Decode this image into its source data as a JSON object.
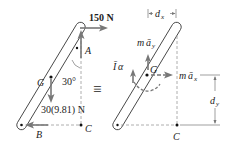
{
  "figure": {
    "left_diagram": {
      "type": "free-body diagram",
      "labels": {
        "force_top": "150 N",
        "point_a": "A",
        "center_g": "G",
        "angle": "30°",
        "weight": "30(9.81) N",
        "point_b": "B",
        "point_c": "C"
      }
    },
    "equivalence_symbol": "≡",
    "right_diagram": {
      "type": "kinetic diagram",
      "labels": {
        "dx_var": "d",
        "dx_sub": "x",
        "ma_y_m": "m",
        "ma_y_a": "ā",
        "ma_y_sub": "y",
        "i_alpha_i": "Ī",
        "i_alpha_alpha": "α",
        "center_g": "G",
        "ma_x_m": "m",
        "ma_x_a": "ā",
        "ma_x_sub": "x",
        "dy_var": "d",
        "dy_sub": "y",
        "point_c": "C"
      }
    },
    "colors": {
      "rod_stroke": "#333333",
      "force_arrow": "#777777",
      "dashed_lines": "#999999",
      "text": "#222222"
    }
  }
}
